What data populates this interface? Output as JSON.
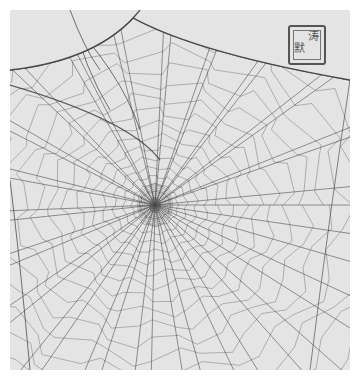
{
  "image": {
    "subject": "Spider web (orb web) drawing with a red-ink style square seal",
    "background_color": "#e4e4e4",
    "border_color": "#ffffff",
    "thread_color": "#3a3a3a",
    "hub": {
      "x": 145,
      "y": 195
    },
    "radial_count": 44,
    "spiral_rings": 20
  },
  "seal": {
    "position": "top-right",
    "glyphs": [
      "默",
      "涛"
    ]
  }
}
